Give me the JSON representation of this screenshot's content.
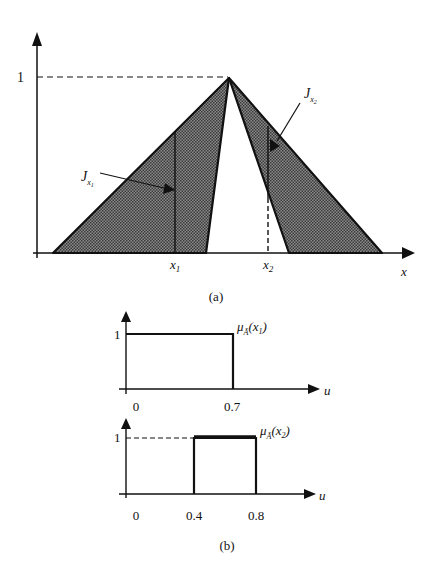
{
  "figure_a": {
    "caption": "(a)",
    "x_axis_label": "x",
    "y_tick_label": "1",
    "x_ticks": [
      {
        "main": "x",
        "sub": "1"
      },
      {
        "main": "x",
        "sub": "2"
      }
    ],
    "annotations": [
      {
        "main": "J",
        "sub": "x",
        "subsub": "1"
      },
      {
        "main": "J",
        "sub": "x",
        "subsub": "2"
      }
    ],
    "shading_color": "#6e6e6e"
  },
  "figure_b": {
    "caption": "(b)",
    "plots": [
      {
        "y_tick": "1",
        "x_axis_label": "u",
        "x_ticks": [
          "0",
          "0.7"
        ],
        "curve_label_main": "μ",
        "curve_label_sub": "Ã",
        "curve_label_arg": "(x",
        "curve_label_arg_sub": "1",
        "curve_label_close": ")",
        "interval": [
          0,
          0.7
        ]
      },
      {
        "y_tick": "1",
        "x_axis_label": "u",
        "x_ticks": [
          "0",
          "0.4",
          "0.8"
        ],
        "curve_label_main": "μ",
        "curve_label_sub": "Ã",
        "curve_label_arg": "(x",
        "curve_label_arg_sub": "2",
        "curve_label_close": ")",
        "interval": [
          0.4,
          0.8
        ]
      }
    ]
  }
}
